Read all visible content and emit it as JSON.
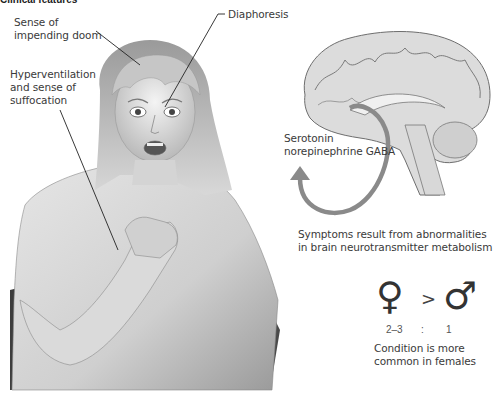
{
  "figure": {
    "title": "Clinical features",
    "labels": {
      "sense_of_doom": [
        "Sense of",
        "impending doom"
      ],
      "diaphoresis": "Diaphoresis",
      "hyperventilation": [
        "Hyperventilation",
        "and sense of",
        "suffocation"
      ],
      "neurotransmitters": [
        "Serotonin",
        "norepinephrine GABA"
      ],
      "symptoms_cause": [
        "Symptoms result from abnormalities",
        "in brain neurotransmitter metabolism"
      ],
      "condition_note": [
        "Condition is more",
        "common in females"
      ]
    },
    "sex_ratio": {
      "female_symbol": "♀",
      "comparator": ">",
      "male_symbol": "♂",
      "female_value": "2–3",
      "separator": ":",
      "male_value": "1"
    },
    "colors": {
      "cycle_arrow": "#8a8a8a",
      "leader_line": "#222222",
      "brain_fill": "#dcdcdc",
      "brain_stroke": "#6e6e6e"
    }
  }
}
